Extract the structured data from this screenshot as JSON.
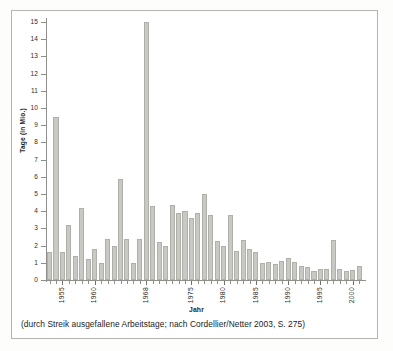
{
  "chart_data": {
    "type": "bar",
    "title": "",
    "subtitle": "",
    "xlabel": "Jahr",
    "ylabel": "Tage (in Mio.)",
    "ylim": [
      0,
      15
    ],
    "ytick_labels": [
      "0",
      "1",
      "2",
      "3",
      "4",
      "5",
      "6",
      "7",
      "8",
      "9",
      "10",
      "11",
      "12",
      "13",
      "14",
      "15"
    ],
    "ytick_values": [
      0,
      1,
      2,
      3,
      4,
      5,
      6,
      7,
      8,
      9,
      10,
      11,
      12,
      13,
      14,
      15
    ],
    "xtick_labels": [
      "1955",
      "1960",
      "1968",
      "1975",
      "1980",
      "1985",
      "1990",
      "1995",
      "2000"
    ],
    "grid": false,
    "legend": false,
    "bar_color": "#c9c9c4",
    "bar_edge_color": "#b0b0aa",
    "axis_color": "#8e8e8a",
    "categories": [
      "1953",
      "1954",
      "1955",
      "1956",
      "1957",
      "1958",
      "1959",
      "1960",
      "1961",
      "1962",
      "1963",
      "1964",
      "1965",
      "1966",
      "1967",
      "1968",
      "1969",
      "1970",
      "1971",
      "1972",
      "1973",
      "1974",
      "1975",
      "1976",
      "1977",
      "1978",
      "1979",
      "1980",
      "1981",
      "1982",
      "1983",
      "1984",
      "1985",
      "1986",
      "1987",
      "1988",
      "1989",
      "1990",
      "1991",
      "1992",
      "1993",
      "1994",
      "1995",
      "1996",
      "1997",
      "1998",
      "1999",
      "2000",
      "2001"
    ],
    "values": [
      1.6,
      9.5,
      1.6,
      3.2,
      1.4,
      4.2,
      1.25,
      1.8,
      1.0,
      2.4,
      1.95,
      5.9,
      2.4,
      1.0,
      2.4,
      15.0,
      4.3,
      2.2,
      2.0,
      4.35,
      3.9,
      4.0,
      3.6,
      3.9,
      5.0,
      3.8,
      2.25,
      2.0,
      3.8,
      1.7,
      2.35,
      1.8,
      1.65,
      1.0,
      1.05,
      0.95,
      1.1,
      1.3,
      1.05,
      0.8,
      0.75,
      0.55,
      0.65,
      0.65,
      2.3,
      0.65,
      0.5,
      0.6,
      0.8
    ],
    "caption": "(durch Streik ausgefallene Arbeitstage; nach Cordellier/Netter 2003, S. 275)"
  }
}
